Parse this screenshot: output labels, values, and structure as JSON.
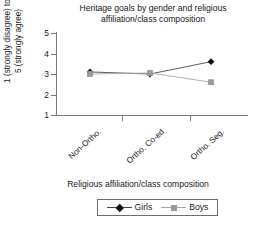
{
  "chart_data": {
    "type": "line",
    "title": "Heritage goals by gender and religious affiliation/class composition",
    "title_lines": [
      "Heritage goals by gender and religious",
      "affiliation/class composition"
    ],
    "xlabel": "Religious affiliation/class composition",
    "ylabel": "1 (strongly disagree) to 5 (strongly agree)",
    "ylabel_lines": [
      "1 (strongly disagree) to",
      "5 (strongly agree)"
    ],
    "categories": [
      "Non-Ortho.",
      "Ortho. Co-ed",
      "Ortho. Seg."
    ],
    "series": [
      {
        "name": "Girls",
        "marker": "diamond",
        "color": "#111111",
        "line_color": "#4a4a4a",
        "values": [
          3.1,
          3.0,
          3.6
        ]
      },
      {
        "name": "Boys",
        "marker": "square",
        "color": "#9a9a9a",
        "line_color": "#a8a8a8",
        "values": [
          3.0,
          3.05,
          2.6
        ]
      }
    ],
    "ylim": [
      1,
      5
    ],
    "yticks": [
      5,
      4,
      3,
      2,
      1
    ],
    "ytick_labels": [
      "5",
      "4",
      "3",
      "2",
      "1"
    ],
    "grid": false,
    "legend_position": "bottom"
  },
  "legend": {
    "girls_label": "Girls",
    "boys_label": "Boys"
  }
}
